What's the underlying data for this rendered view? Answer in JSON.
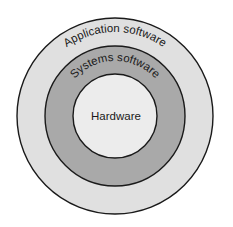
{
  "diagram": {
    "type": "concentric-circles",
    "layers": [
      {
        "label": "Application software",
        "fill": "#e0e0e0",
        "position": "outer"
      },
      {
        "label": "Systems software",
        "fill": "#a9a9a9",
        "position": "middle"
      },
      {
        "label": "Hardware",
        "fill": "#ececec",
        "position": "inner"
      }
    ],
    "stroke": "#1a1a1a"
  }
}
